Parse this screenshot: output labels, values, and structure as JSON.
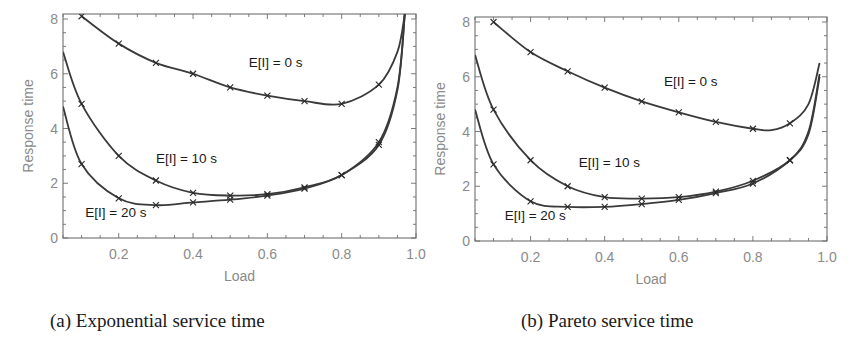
{
  "figure": {
    "captions": [
      "(a) Exponential service time",
      "(b) Pareto service time"
    ]
  },
  "chart_data": [
    {
      "type": "line",
      "title": "(a) Exponential service time",
      "xlabel": "Load",
      "ylabel": "Response time",
      "xlim": [
        0.05,
        1.0
      ],
      "ylim": [
        0,
        8
      ],
      "xticks": [
        "0.2",
        "0.4",
        "0.6",
        "0.8",
        "1.0"
      ],
      "yticks": [
        "0",
        "2",
        "4",
        "6",
        "8"
      ],
      "grid": false,
      "legend": "inline labels",
      "markers": "x at 0.1 load intervals",
      "series": [
        {
          "name": "E[I] = 0 s",
          "label_pos": [
            0.55,
            6.25
          ],
          "x": [
            0.1,
            0.2,
            0.3,
            0.4,
            0.5,
            0.6,
            0.7,
            0.8,
            0.9,
            0.95,
            0.97
          ],
          "values": [
            8.1,
            7.1,
            6.4,
            6.0,
            5.5,
            5.2,
            5.0,
            4.9,
            5.6,
            6.8,
            8.2
          ],
          "markers_x": [
            0.1,
            0.2,
            0.3,
            0.4,
            0.5,
            0.6,
            0.7,
            0.8,
            0.9
          ]
        },
        {
          "name": "E[I] = 10 s",
          "label_pos": [
            0.3,
            2.75
          ],
          "x": [
            0.05,
            0.1,
            0.2,
            0.3,
            0.4,
            0.5,
            0.6,
            0.7,
            0.8,
            0.9,
            0.95,
            0.97
          ],
          "values": [
            6.8,
            4.9,
            3.0,
            2.1,
            1.65,
            1.55,
            1.6,
            1.85,
            2.3,
            3.5,
            5.5,
            8.2
          ],
          "markers_x": [
            0.1,
            0.2,
            0.3,
            0.4,
            0.5,
            0.6,
            0.7,
            0.8,
            0.9
          ]
        },
        {
          "name": "E[I] = 20 s",
          "label_pos": [
            0.11,
            0.75
          ],
          "x": [
            0.05,
            0.1,
            0.2,
            0.3,
            0.4,
            0.5,
            0.6,
            0.7,
            0.8,
            0.9,
            0.95,
            0.97
          ],
          "values": [
            4.8,
            2.7,
            1.45,
            1.2,
            1.3,
            1.4,
            1.55,
            1.8,
            2.3,
            3.4,
            5.4,
            8.2
          ],
          "markers_x": [
            0.1,
            0.2,
            0.3,
            0.4,
            0.5,
            0.6,
            0.7,
            0.8,
            0.9
          ]
        }
      ]
    },
    {
      "type": "line",
      "title": "(b) Pareto service time",
      "xlabel": "Load",
      "ylabel": "Response time",
      "xlim": [
        0.05,
        1.0
      ],
      "ylim": [
        0,
        8
      ],
      "xticks": [
        "0.2",
        "0.4",
        "0.6",
        "0.8",
        "1.0"
      ],
      "yticks": [
        "0",
        "2",
        "4",
        "6",
        "8"
      ],
      "grid": false,
      "legend": "inline labels",
      "markers": "x at 0.1 load intervals",
      "series": [
        {
          "name": "E[I] = 0 s",
          "label_pos": [
            0.56,
            5.65
          ],
          "x": [
            0.1,
            0.2,
            0.3,
            0.4,
            0.5,
            0.6,
            0.7,
            0.8,
            0.85,
            0.9,
            0.95,
            0.98
          ],
          "values": [
            8.0,
            6.9,
            6.2,
            5.6,
            5.1,
            4.7,
            4.35,
            4.1,
            4.05,
            4.3,
            5.0,
            6.5
          ],
          "markers_x": [
            0.1,
            0.2,
            0.3,
            0.4,
            0.5,
            0.6,
            0.7,
            0.8,
            0.9
          ]
        },
        {
          "name": "E[I] = 10 s",
          "label_pos": [
            0.33,
            2.7
          ],
          "x": [
            0.05,
            0.1,
            0.2,
            0.3,
            0.4,
            0.5,
            0.6,
            0.7,
            0.8,
            0.9,
            0.95,
            0.98
          ],
          "values": [
            6.8,
            4.8,
            2.95,
            2.0,
            1.6,
            1.55,
            1.6,
            1.8,
            2.2,
            2.95,
            4.0,
            6.1
          ],
          "markers_x": [
            0.1,
            0.2,
            0.3,
            0.4,
            0.5,
            0.6,
            0.7,
            0.8,
            0.9
          ]
        },
        {
          "name": "E[I] = 20 s",
          "label_pos": [
            0.13,
            0.75
          ],
          "x": [
            0.05,
            0.1,
            0.2,
            0.3,
            0.4,
            0.5,
            0.6,
            0.7,
            0.8,
            0.9,
            0.95,
            0.98
          ],
          "values": [
            4.8,
            2.8,
            1.45,
            1.25,
            1.25,
            1.35,
            1.5,
            1.75,
            2.1,
            2.95,
            3.9,
            6.0
          ],
          "markers_x": [
            0.1,
            0.2,
            0.3,
            0.4,
            0.5,
            0.6,
            0.7,
            0.8,
            0.9
          ]
        }
      ]
    }
  ]
}
